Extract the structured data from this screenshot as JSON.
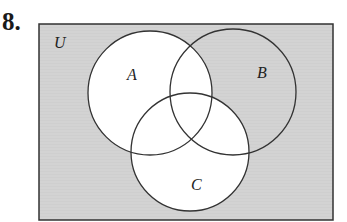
{
  "problem_number": "8.",
  "diagram": {
    "type": "venn",
    "universe_label": "U",
    "sets": [
      {
        "label": "A",
        "cx": 150,
        "cy": 93,
        "r": 62
      },
      {
        "label": "B",
        "cx": 233,
        "cy": 92,
        "r": 63
      },
      {
        "label": "C",
        "cx": 190,
        "cy": 152,
        "r": 59
      }
    ],
    "shaded_region_description": "U minus (A union C), i.e. everything outside A and C",
    "colors": {
      "shade": "#d4d4d4",
      "unshaded": "#ffffff",
      "stroke": "#333333"
    }
  }
}
